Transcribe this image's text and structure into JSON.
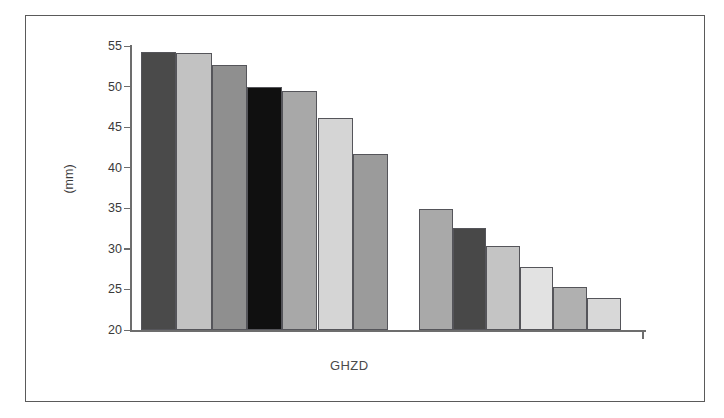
{
  "chart_data": {
    "type": "bar",
    "title": "",
    "subtitle": "",
    "xlabel": "GHZD",
    "ylabel": "(mm)",
    "ylim": [
      20,
      55
    ],
    "yticks": [
      20,
      25,
      30,
      35,
      40,
      45,
      50,
      55
    ],
    "ytick_labels": [
      "20",
      "25",
      "30",
      "35",
      "40",
      "45",
      "50",
      "55"
    ],
    "grid": false,
    "legend": "none",
    "categories": [
      "1",
      "2",
      "3",
      "4",
      "5",
      "6",
      "7",
      "8",
      "9",
      "10",
      "11",
      "12",
      "13"
    ],
    "values": [
      54.3,
      54.1,
      52.6,
      50.0,
      49.5,
      46.1,
      41.7,
      34.9,
      32.6,
      30.3,
      27.8,
      25.3,
      23.9
    ],
    "groups": [
      {
        "name": "group-1",
        "values": [
          54.3,
          54.1,
          52.6,
          50.0,
          49.5,
          46.1,
          41.7
        ]
      },
      {
        "name": "group-2",
        "values": [
          34.9,
          32.6,
          30.3,
          27.8,
          25.3,
          23.9
        ]
      }
    ],
    "bar_colors": [
      "#4a4a4a",
      "#c2c2c2",
      "#8f8f8f",
      "#101010",
      "#a8a8a8",
      "#d5d5d5",
      "#9b9b9b",
      "#a9a9a9",
      "#484848",
      "#c4c4c4",
      "#e2e2e2",
      "#b0b0b0",
      "#d8d8d8"
    ],
    "bar_edge_color": "#55555a",
    "axis_color": "#6d6d6d",
    "frame_color": "#5a5a5a",
    "background": "#ffffff"
  }
}
